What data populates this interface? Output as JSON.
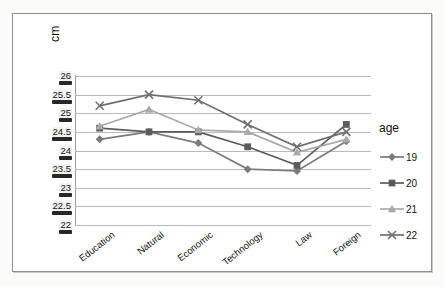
{
  "chart_data": {
    "type": "line",
    "title": "",
    "xlabel": "",
    "ylabel": "cm",
    "ylim": [
      22,
      26
    ],
    "ytick_labels": [
      "26",
      "25.5",
      "25",
      "24.5",
      "24",
      "23.5",
      "23",
      "22.5",
      "22"
    ],
    "ytick_values": [
      26,
      25.5,
      25,
      24.5,
      24,
      23.5,
      23,
      22.5,
      22
    ],
    "grid": true,
    "legend_position": "right",
    "legend_title": "age",
    "categories": [
      "Education",
      "Natural",
      "Economic",
      "Technology",
      "Law",
      "Foreign"
    ],
    "series": [
      {
        "name": "19",
        "marker": "diamond",
        "color": "#7b7b7b",
        "values": [
          24.3,
          24.5,
          24.2,
          23.5,
          23.45,
          24.25
        ]
      },
      {
        "name": "20",
        "marker": "square",
        "color": "#5c5c5c",
        "values": [
          24.6,
          24.5,
          24.5,
          24.1,
          23.6,
          24.7
        ]
      },
      {
        "name": "21",
        "marker": "triangle",
        "color": "#a9a9a9",
        "values": [
          24.65,
          25.1,
          24.55,
          24.5,
          23.95,
          24.3
        ]
      },
      {
        "name": "22",
        "marker": "cross",
        "color": "#6f6f6f",
        "values": [
          25.2,
          25.5,
          25.35,
          24.7,
          24.1,
          24.5
        ]
      }
    ]
  },
  "legend": {
    "title": "age",
    "entries": [
      {
        "label": "19",
        "marker": "diamond",
        "color": "#7b7b7b"
      },
      {
        "label": "20",
        "marker": "square",
        "color": "#5c5c5c"
      },
      {
        "label": "21",
        "marker": "triangle",
        "color": "#a9a9a9"
      },
      {
        "label": "22",
        "marker": "cross",
        "color": "#6f6f6f"
      }
    ]
  },
  "axis": {
    "y_title": "cm"
  },
  "colors": {
    "gridline": "#b9bcbe",
    "frame": "#8d8f91",
    "text": "#111111"
  }
}
